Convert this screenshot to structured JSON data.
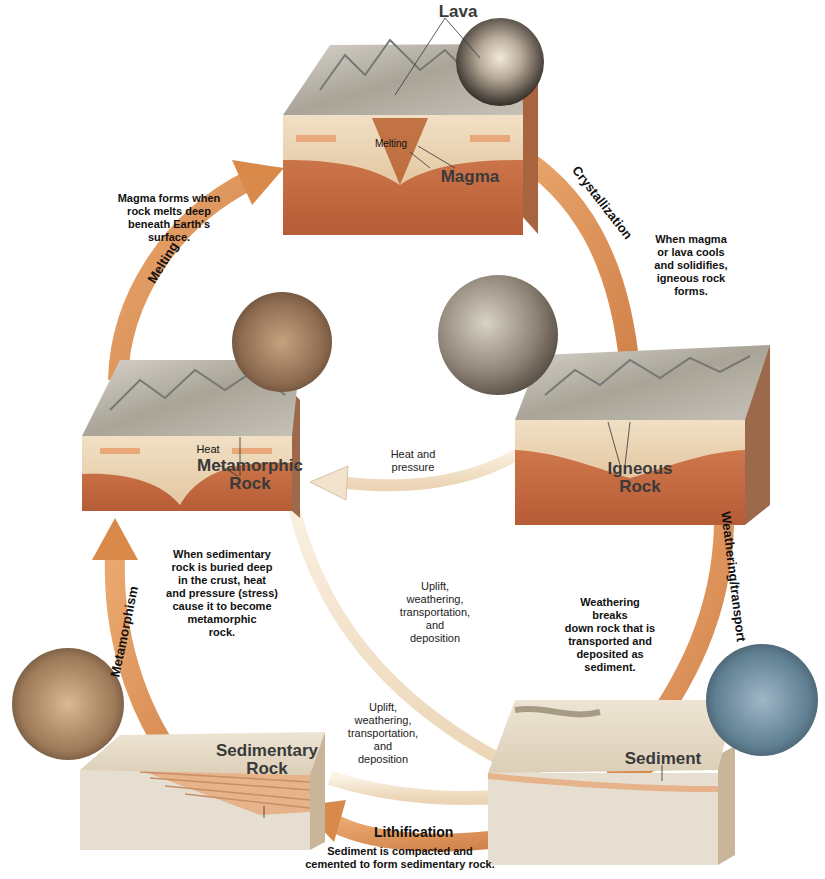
{
  "diagram": {
    "type": "rock-cycle",
    "colors": {
      "arrow_orange": "#E39A5E",
      "arrow_orange_dark": "#C9773E",
      "arrow_light": "#F3E3CC",
      "mantle": "#CF7446",
      "mantle_dark": "#B45A34",
      "crust": "#E9D3B2",
      "surface": "#C8C1B4",
      "side": "#9C7A63",
      "photo_dark": "#3b3b3b"
    },
    "blocks": {
      "magma": {
        "labels": [
          "Lava",
          "Melting",
          "Magma"
        ]
      },
      "metamorphic": {
        "labels": [
          "Heat",
          "Metamorphic",
          "Rock"
        ]
      },
      "igneous": {
        "labels": [
          "Igneous",
          "Rock"
        ]
      },
      "sedimentary": {
        "labels": [
          "Sedimentary",
          "Rock"
        ]
      },
      "sediment": {
        "labels": [
          "Sediment"
        ]
      }
    },
    "processes": {
      "melting": "Melting",
      "crystallization": "Crystallization",
      "weathering": "Weathering/transport",
      "lithification": "Lithification",
      "metamorphism": "Metamorphism",
      "heat_pressure": [
        "Heat and",
        "pressure"
      ],
      "uplift_1": [
        "Uplift,",
        "weathering,",
        "transportation,",
        "and",
        "deposition"
      ],
      "uplift_2": [
        "Uplift,",
        "weathering,",
        "transportation,",
        "and",
        "deposition"
      ]
    },
    "captions": {
      "melting": [
        "Magma forms when",
        "rock melts deep",
        "beneath Earth's",
        "surface."
      ],
      "crystallization": [
        "When magma",
        "or lava cools",
        "and solidifies,",
        "igneous rock",
        "forms."
      ],
      "metamorphism": [
        "When sedimentary",
        "rock is buried deep",
        "in the crust, heat",
        "and pressure (stress)",
        "cause it to become",
        "metamorphic",
        "rock."
      ],
      "weathering": [
        "Weathering",
        "breaks",
        "down rock that is",
        "transported and",
        "deposited as",
        "sediment."
      ],
      "lithification": [
        "Sediment is compacted and",
        "cemented to form sedimentary rock."
      ]
    }
  }
}
